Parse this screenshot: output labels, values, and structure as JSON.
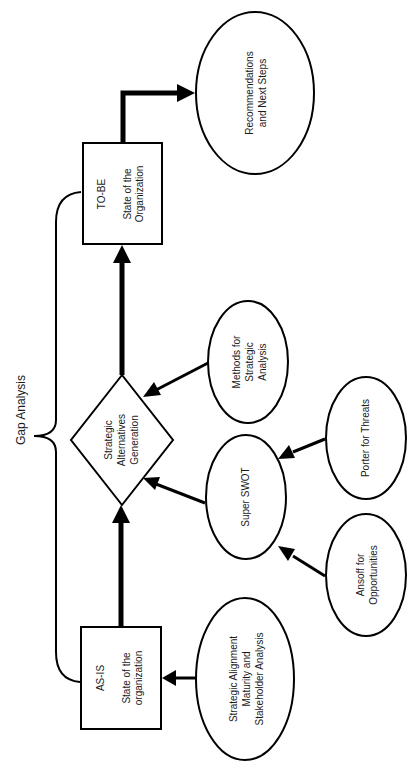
{
  "diagram": {
    "orientation": "rotated -90deg",
    "bracket_label": "Gap Analysis",
    "nodes": {
      "as_is": {
        "shape": "rectangle",
        "lines": [
          "AS-IS",
          "",
          "State of the",
          "organization"
        ]
      },
      "to_be": {
        "shape": "rectangle",
        "lines": [
          "TO-BE",
          "",
          "State of the",
          "Organization"
        ]
      },
      "strategic_alternatives": {
        "shape": "diamond",
        "lines": [
          "Strategic",
          "Alternatives",
          "Generation"
        ]
      },
      "recommendations": {
        "shape": "ellipse",
        "lines": [
          "Recommendations",
          "and Next Steps"
        ]
      },
      "methods": {
        "shape": "ellipse",
        "lines": [
          "Methods for",
          "Strategic",
          "Analysis"
        ]
      },
      "super_swot": {
        "shape": "ellipse",
        "lines": [
          "Super SWOT"
        ]
      },
      "porter": {
        "shape": "ellipse",
        "lines": [
          "Porter for Threats"
        ]
      },
      "ansoff": {
        "shape": "ellipse",
        "lines": [
          "Ansoff for",
          "Opportunities"
        ]
      },
      "strategic_alignment": {
        "shape": "ellipse",
        "lines": [
          "Strategic Alignment",
          "Maturity and",
          "Stakeholder Analysis"
        ]
      }
    },
    "edges": [
      {
        "from": "strategic_alignment",
        "to": "as_is"
      },
      {
        "from": "as_is",
        "to": "strategic_alternatives"
      },
      {
        "from": "ansoff",
        "to": "super_swot"
      },
      {
        "from": "porter",
        "to": "super_swot"
      },
      {
        "from": "super_swot",
        "to": "strategic_alternatives"
      },
      {
        "from": "methods",
        "to": "strategic_alternatives"
      },
      {
        "from": "strategic_alternatives",
        "to": "to_be"
      },
      {
        "from": "to_be",
        "to": "recommendations"
      }
    ],
    "colors": {
      "stroke": "#000000",
      "background": "#ffffff",
      "text": "#1a1a1a"
    }
  }
}
